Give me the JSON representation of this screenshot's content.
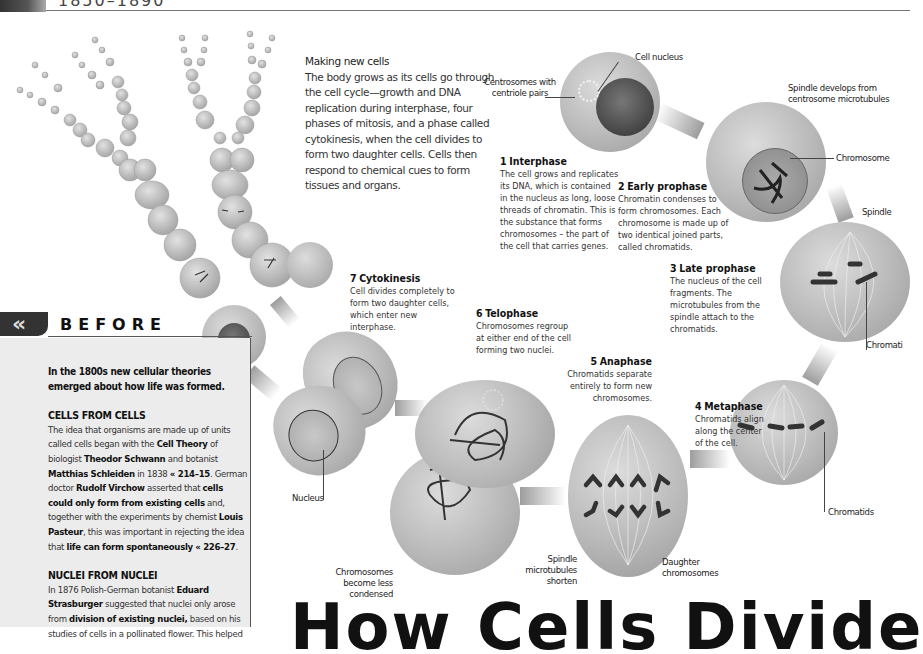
{
  "header": {
    "running_head": "1850–1890"
  },
  "intro": {
    "title": "Making new cells",
    "body": "The body grows as its cells go through the cell cycle—growth and DNA replication during interphase, four phases of mitosis, and a phase called cytokinesis, when the cell divides to form two daughter cells. Cells then respond to chemical cues to form tissues and organs."
  },
  "stages": [
    {
      "num": "1",
      "title": "Interphase",
      "body": "The cell grows and replicates its DNA, which is contained in the nucleus as long, loose threads of chromatin. This is the substance that forms chromosomes – the part of the cell that carries genes."
    },
    {
      "num": "2",
      "title": "Early prophase",
      "body": "Chromatin condenses to form chromosomes. Each chromosome is made up of two identical joined parts, called chromatids."
    },
    {
      "num": "3",
      "title": "Late prophase",
      "body": "The nucleus of the cell fragments. The microtubules from the spindle attach to the chromatids."
    },
    {
      "num": "4",
      "title": "Metaphase",
      "body": "Chromatids align along the center of the cell."
    },
    {
      "num": "5",
      "title": "Anaphase",
      "body": "Chromatids separate entirely to form new chromosomes."
    },
    {
      "num": "6",
      "title": "Telophase",
      "body": "Chromosomes regroup at either end of the cell forming two nuclei."
    },
    {
      "num": "7",
      "title": "Cytokinesis",
      "body": "Cell divides completely to form two daughter cells, which enter new interphase."
    }
  ],
  "labels": {
    "centrosomes": "Centrosomes with centriole pairs",
    "cell_nucleus": "Cell nucleus",
    "spindle_develops": "Spindle develops from centrosome microtubules",
    "chromosome": "Chromosome",
    "spindle": "Spindle",
    "chromatids_top": "Chromati",
    "chromatids": "Chromatids",
    "daughter_chromosomes": "Daughter chromosomes",
    "spindle_shorten": "Spindle microtubules shorten",
    "chromosomes_less_condensed": "Chromosomes become less condensed",
    "nucleus": "Nucleus"
  },
  "before": {
    "icon": "double-chevron-left",
    "title": "BEFORE",
    "lead": "In the 1800s new cellular theories emerged about how life was formed.",
    "sections": [
      {
        "heading": "CELLS FROM CELLS",
        "body_parts": [
          "The idea that organisms are made up of units called cells began with the ",
          "Cell Theory",
          " of biologist ",
          "Theodor Schwann",
          " and botanist ",
          "Matthias Schleiden",
          " in 1838 ",
          "« 214–15",
          ". German doctor ",
          "Rudolf Virchow",
          " asserted that ",
          "cells could only form from existing cells",
          " and, together with the experiments by chemist ",
          "Louis Pasteur",
          ", this was important in rejecting the idea that ",
          "life can form spontaneously",
          " ",
          "« 226–27",
          "."
        ]
      },
      {
        "heading": "NUCLEI FROM NUCLEI",
        "body_parts": [
          "In 1876 Polish-German botanist ",
          "Eduard Strasburger",
          " suggested that nuclei only arose from ",
          "division of existing nuclei,",
          " based on his studies of cells in a pollinated flower. This helped"
        ]
      }
    ]
  },
  "page_title": "How Cells Divide",
  "colors": {
    "band": "#333333",
    "panel": "#ececec",
    "cell_light": "#dcdcdc",
    "cell_dark": "#9a9a9a",
    "text": "#222222"
  }
}
